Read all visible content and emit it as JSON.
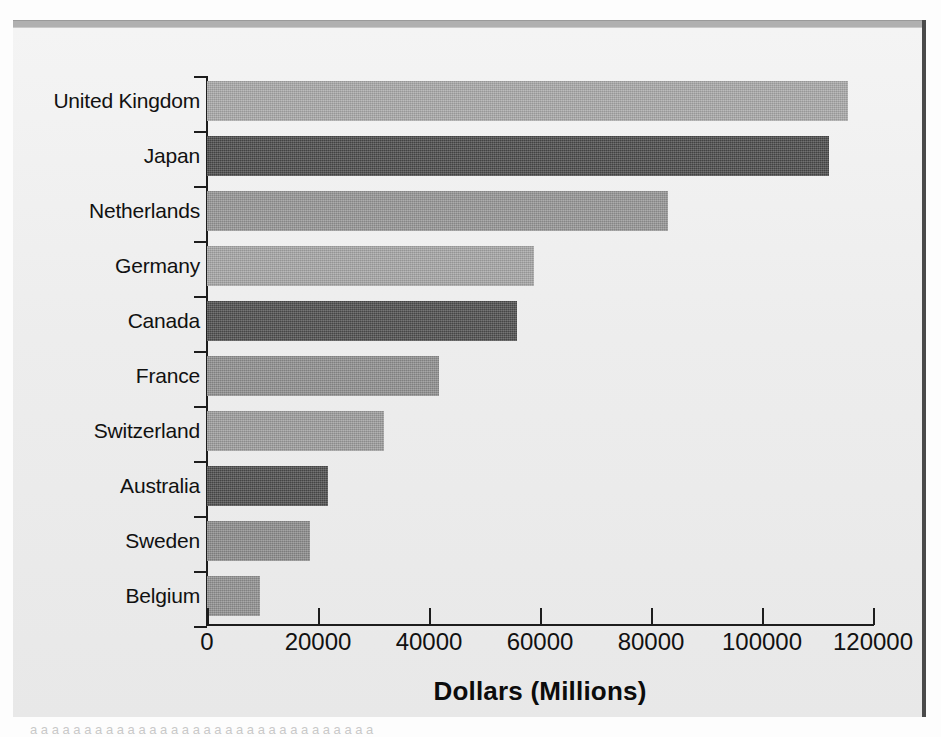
{
  "chart_data": {
    "type": "bar",
    "orientation": "horizontal",
    "title": "",
    "xlabel": "Dollars (Millions)",
    "ylabel": "",
    "categories": [
      "United Kingdom",
      "Japan",
      "Netherlands",
      "Germany",
      "Canada",
      "France",
      "Switzerland",
      "Australia",
      "Sweden",
      "Belgium"
    ],
    "values": [
      115500,
      112000,
      83000,
      59000,
      55800,
      41800,
      31900,
      21800,
      18600,
      9500
    ],
    "bar_colors": [
      "#a8a8a8",
      "#4a4a4a",
      "#959595",
      "#a5a5a5",
      "#4e4e4e",
      "#8e8e8e",
      "#9c9c9c",
      "#4c4c4c",
      "#8b8b8b",
      "#909090"
    ],
    "xlim": [
      0,
      120000
    ],
    "xticks": [
      0,
      20000,
      40000,
      60000,
      80000,
      100000,
      120000
    ],
    "xticklabels": [
      "0",
      "20000",
      "40000",
      "60000",
      "80000",
      "100000",
      "120000"
    ],
    "grid": false,
    "legend": "none"
  },
  "figure": {
    "background_color": "#eeeeee",
    "axis_color": "#1d1d1d",
    "text_color": "#111111"
  },
  "page": {
    "bleed_text": "a a a a a a a a a a a a a a a a a a a a a a a a a a a a a a a a"
  }
}
